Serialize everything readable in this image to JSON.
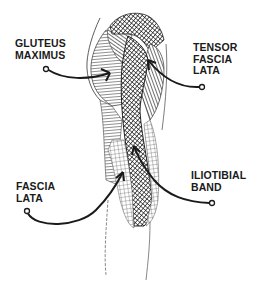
{
  "diagram": {
    "colors": {
      "ink": "#1a1a1a",
      "background": "#ffffff"
    },
    "labels": [
      {
        "id": "gluteus-maximus",
        "lines": [
          "GLUTEUS",
          "MAXIMUS"
        ]
      },
      {
        "id": "tensor-fascia-lata",
        "lines": [
          "TENSOR",
          "FASCIA",
          "LATA"
        ]
      },
      {
        "id": "fascia-lata",
        "lines": [
          "FASCIA",
          "LATA"
        ]
      },
      {
        "id": "iliotibial-band",
        "lines": [
          "ILIOTIBIAL",
          "BAND"
        ]
      }
    ]
  }
}
